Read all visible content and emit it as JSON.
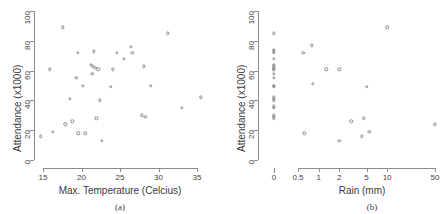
{
  "figure": {
    "caption_a": "(a)",
    "caption_b": "(b)"
  },
  "chart_data": [
    {
      "id": "panel-a",
      "type": "scatter",
      "title": "",
      "xlabel": "Max. Temperature (Celcius)",
      "ylabel": "Attendance  (x1000)",
      "caption": "(a)",
      "xlim": [
        14.2,
        36.0
      ],
      "ylim": [
        0,
        100
      ],
      "xticks": [
        15,
        20,
        25,
        30,
        35
      ],
      "xticklabels": [
        "15",
        "20",
        "25",
        "30",
        "35"
      ],
      "yticks": [
        0,
        20,
        40,
        60,
        80,
        100
      ],
      "yticklabels": [
        "0",
        "20",
        "40",
        "60",
        "80",
        "100"
      ],
      "grid": false,
      "legend": null,
      "marker": "open-circle",
      "points": [
        {
          "x": 14.7,
          "y": 16
        },
        {
          "x": 15.9,
          "y": 61
        },
        {
          "x": 16.3,
          "y": 19
        },
        {
          "x": 17.6,
          "y": 89
        },
        {
          "x": 17.9,
          "y": 24
        },
        {
          "x": 18.5,
          "y": 41
        },
        {
          "x": 18.8,
          "y": 26
        },
        {
          "x": 19.3,
          "y": 55
        },
        {
          "x": 19.5,
          "y": 72
        },
        {
          "x": 19.6,
          "y": 18
        },
        {
          "x": 20.2,
          "y": 50
        },
        {
          "x": 20.5,
          "y": 18
        },
        {
          "x": 21.2,
          "y": 64
        },
        {
          "x": 21.4,
          "y": 58
        },
        {
          "x": 21.5,
          "y": 63
        },
        {
          "x": 21.6,
          "y": 73
        },
        {
          "x": 21.8,
          "y": 62
        },
        {
          "x": 21.9,
          "y": 28
        },
        {
          "x": 22.2,
          "y": 61
        },
        {
          "x": 22.4,
          "y": 40
        },
        {
          "x": 22.6,
          "y": 13
        },
        {
          "x": 23.8,
          "y": 49
        },
        {
          "x": 24.1,
          "y": 61
        },
        {
          "x": 24.6,
          "y": 72
        },
        {
          "x": 25.5,
          "y": 68
        },
        {
          "x": 26.4,
          "y": 76
        },
        {
          "x": 26.6,
          "y": 72
        },
        {
          "x": 27.8,
          "y": 30
        },
        {
          "x": 28.1,
          "y": 63
        },
        {
          "x": 28.3,
          "y": 29
        },
        {
          "x": 29.0,
          "y": 50
        },
        {
          "x": 31.2,
          "y": 85
        },
        {
          "x": 33.0,
          "y": 35
        },
        {
          "x": 35.5,
          "y": 42
        }
      ]
    },
    {
      "id": "panel-b",
      "type": "scatter",
      "title": "",
      "xlabel": "Rain (mm)",
      "ylabel": "Attendance  (x1000)",
      "caption": "(b)",
      "xscale": "log-with-zero-break",
      "ylim": [
        0,
        100
      ],
      "xticks": [
        0,
        0.5,
        1,
        2,
        5,
        10,
        50
      ],
      "xticklabels": [
        "0",
        "0.5",
        "1",
        "2",
        "5",
        "10",
        "50"
      ],
      "yticks": [
        0,
        20,
        40,
        60,
        80,
        100
      ],
      "yticklabels": [
        "0",
        "20",
        "40",
        "60",
        "80",
        "100"
      ],
      "grid": false,
      "legend": null,
      "marker": "open-circle",
      "zero_column_values": [
        85,
        74,
        73,
        72,
        68,
        64,
        63,
        62,
        61,
        61,
        58,
        55,
        50,
        50,
        49,
        42,
        41,
        40,
        36,
        35,
        30,
        29,
        28
      ],
      "points": [
        {
          "x": 0.6,
          "y": 72
        },
        {
          "x": 0.62,
          "y": 18
        },
        {
          "x": 0.8,
          "y": 77
        },
        {
          "x": 0.82,
          "y": 51
        },
        {
          "x": 1.3,
          "y": 61
        },
        {
          "x": 2.0,
          "y": 61
        },
        {
          "x": 2.0,
          "y": 13
        },
        {
          "x": 3.0,
          "y": 26
        },
        {
          "x": 4.3,
          "y": 16
        },
        {
          "x": 4.6,
          "y": 28
        },
        {
          "x": 5.0,
          "y": 49
        },
        {
          "x": 5.5,
          "y": 19
        },
        {
          "x": 10.0,
          "y": 89
        },
        {
          "x": 50.0,
          "y": 24
        }
      ]
    }
  ]
}
